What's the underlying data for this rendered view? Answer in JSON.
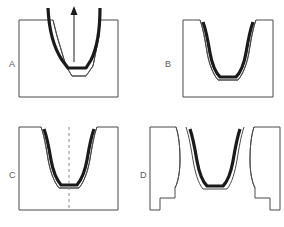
{
  "figure": {
    "background_color": "#ffffff",
    "width": 284,
    "height": 227,
    "colors": {
      "die_stroke": "#4b4b4d",
      "part_stroke": "#1a1a1a",
      "label_text": "#58585a",
      "centerline": "#8a8a8c"
    },
    "panels": [
      {
        "id": "A",
        "label": "A",
        "description": "Punch drawing blank into V die cavity, upward arrow shows punch direction",
        "has_arrow": true,
        "arrow_direction": "up",
        "has_centerline": false,
        "split_die": false
      },
      {
        "id": "B",
        "label": "B",
        "description": "Formed part seated in closed die cavity",
        "has_arrow": false,
        "has_centerline": false,
        "split_die": false
      },
      {
        "id": "C",
        "label": "C",
        "description": "Formed part in die with vertical dashed centerline",
        "has_arrow": false,
        "has_centerline": true,
        "split_die": false
      },
      {
        "id": "D",
        "label": "D",
        "description": "Split die halves opened releasing the formed part",
        "has_arrow": false,
        "has_centerline": false,
        "split_die": true
      }
    ]
  }
}
